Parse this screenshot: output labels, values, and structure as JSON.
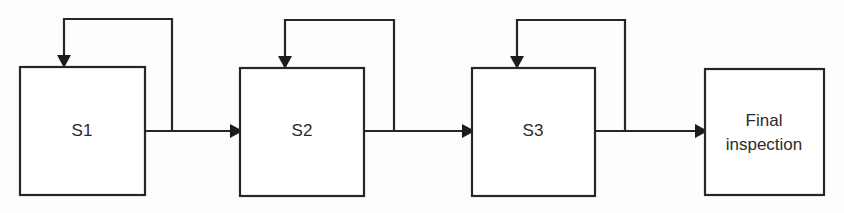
{
  "diagram": {
    "type": "process-flow",
    "background_color": "#fdfdfd",
    "line_color": "#262626",
    "text_color": "#2b2b2b",
    "nodes": [
      {
        "id": "s1",
        "label": "S1",
        "label_lines": [
          "S1"
        ],
        "x": 20,
        "y": 67,
        "width": 125,
        "height": 128,
        "has_feedback_loop": true
      },
      {
        "id": "s2",
        "label": "S2",
        "label_lines": [
          "S2"
        ],
        "x": 240,
        "y": 68,
        "width": 124,
        "height": 128,
        "has_feedback_loop": true
      },
      {
        "id": "s3",
        "label": "S3",
        "label_lines": [
          "S3"
        ],
        "x": 472,
        "y": 68,
        "width": 123,
        "height": 128,
        "has_feedback_loop": true
      },
      {
        "id": "final-inspection",
        "label": "Final inspection",
        "label_lines": [
          "Final",
          "inspection"
        ],
        "x": 705,
        "y": 69,
        "width": 119,
        "height": 126,
        "has_feedback_loop": false
      }
    ],
    "connections": [
      {
        "id": "s1-to-s2",
        "from": "s1",
        "to": "s2",
        "direction": "right"
      },
      {
        "id": "s2-to-s3",
        "from": "s2",
        "to": "s3",
        "direction": "right"
      },
      {
        "id": "s3-to-final-inspection",
        "from": "s3",
        "to": "final-inspection",
        "direction": "right"
      }
    ],
    "feedback_loops": [
      {
        "id": "s1-rework-loop",
        "target": "s1",
        "branch_x": 172,
        "top_y": 19,
        "drop_x": 64
      },
      {
        "id": "s2-rework-loop",
        "target": "s2",
        "branch_x": 394,
        "top_y": 20,
        "drop_x": 285
      },
      {
        "id": "s3-rework-loop",
        "target": "s3",
        "branch_x": 625,
        "top_y": 20,
        "drop_x": 517
      }
    ],
    "flow_line_y": 131
  }
}
